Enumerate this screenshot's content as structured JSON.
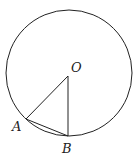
{
  "diagram": {
    "type": "geometry",
    "circle": {
      "cx": 69,
      "cy": 73,
      "r": 63,
      "stroke": "#222222"
    },
    "points": {
      "O": {
        "x": 68,
        "y": 76,
        "label": "O"
      },
      "A": {
        "x": 26,
        "y": 119,
        "label": "A"
      },
      "B": {
        "x": 68,
        "y": 136,
        "label": "B"
      }
    },
    "segments": [
      "OA",
      "OB",
      "AB"
    ]
  }
}
